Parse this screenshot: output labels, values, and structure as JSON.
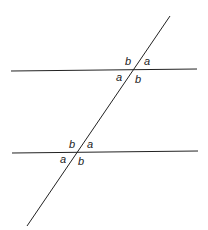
{
  "diagram": {
    "lines": {
      "upper_parallel": {
        "x1": 11,
        "y1": 71,
        "x2": 197,
        "y2": 69
      },
      "lower_parallel": {
        "x1": 12,
        "y1": 153,
        "x2": 198,
        "y2": 151
      },
      "transversal": {
        "x1": 170,
        "y1": 16,
        "x2": 27,
        "y2": 226
      }
    },
    "upper_intersection": {
      "top_left": "b",
      "top_right": "a",
      "bottom_left": "a",
      "bottom_right": "b"
    },
    "lower_intersection": {
      "top_left": "b",
      "top_right": "a",
      "bottom_left": "a",
      "bottom_right": "b"
    },
    "line_color": "#222222"
  }
}
